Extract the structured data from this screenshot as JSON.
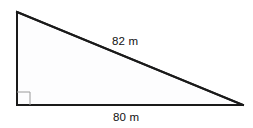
{
  "figure": {
    "name": "right-triangle-diagram",
    "type": "geometry-diagram",
    "background_color": "#ffffff"
  },
  "shape": {
    "kind": "right triangle",
    "fill_color": "#fdfdfe",
    "stroke_color": "#1a1a1a",
    "stroke_width": 2,
    "vertices": {
      "top_left": {
        "x": 17,
        "y": 12
      },
      "bottom_left": {
        "x": 17,
        "y": 105
      },
      "bottom_right": {
        "x": 243,
        "y": 105
      }
    }
  },
  "right_angle_marker": {
    "vertex": "bottom_left",
    "size": 13,
    "stroke_color": "#9a9a9a",
    "stroke_width": 1
  },
  "labels": {
    "hypotenuse": {
      "text": "82 m",
      "value": 82,
      "unit": "m",
      "side": "hypotenuse",
      "color": "#111111"
    },
    "base": {
      "text": "80 m",
      "value": 80,
      "unit": "m",
      "side": "horizontal leg",
      "color": "#111111"
    }
  }
}
